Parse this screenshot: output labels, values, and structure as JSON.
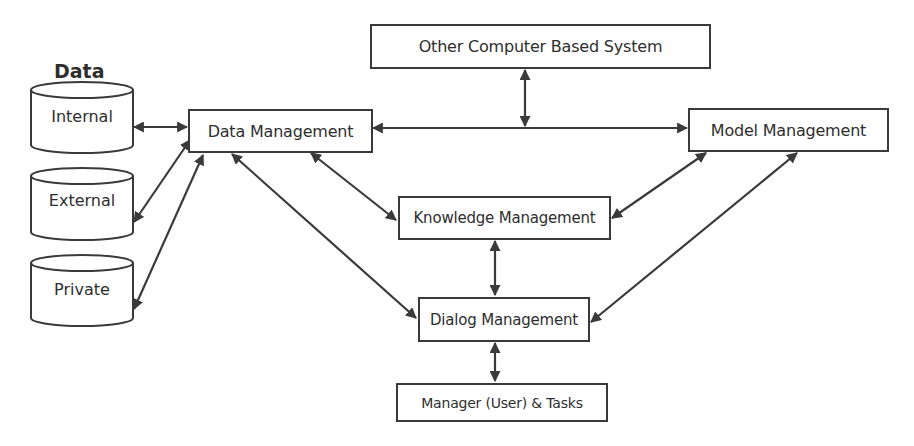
{
  "diagram": {
    "title": "Data",
    "data_sources": [
      {
        "id": "internal",
        "label": "Internal"
      },
      {
        "id": "external",
        "label": "External"
      },
      {
        "id": "private",
        "label": "Private"
      }
    ],
    "nodes": {
      "other_system": "Other Computer Based System",
      "data_management": "Data Management",
      "model_management": "Model Management",
      "knowledge_management": "Knowledge Management",
      "dialog_management": "Dialog Management",
      "manager_tasks": "Manager (User) & Tasks"
    },
    "edges": [
      {
        "from": "internal",
        "to": "data_management",
        "type": "bidirectional"
      },
      {
        "from": "external",
        "to": "data_management",
        "type": "bidirectional"
      },
      {
        "from": "private",
        "to": "data_management",
        "type": "bidirectional"
      },
      {
        "from": "data_management",
        "to": "model_management",
        "type": "bidirectional"
      },
      {
        "from": "other_system",
        "to": "data_model_link",
        "type": "bidirectional"
      },
      {
        "from": "data_management",
        "to": "knowledge_management",
        "type": "bidirectional"
      },
      {
        "from": "data_management",
        "to": "dialog_management",
        "type": "bidirectional"
      },
      {
        "from": "model_management",
        "to": "knowledge_management",
        "type": "bidirectional"
      },
      {
        "from": "model_management",
        "to": "dialog_management",
        "type": "bidirectional"
      },
      {
        "from": "knowledge_management",
        "to": "dialog_management",
        "type": "bidirectional"
      },
      {
        "from": "dialog_management",
        "to": "manager_tasks",
        "type": "bidirectional"
      }
    ],
    "colors": {
      "stroke": "#3a3a3a",
      "text": "#2e2e2e",
      "background": "#ffffff"
    }
  }
}
